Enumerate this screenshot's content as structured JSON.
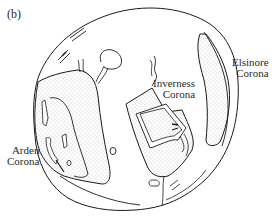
{
  "figure": {
    "panel_label": "(b)",
    "colors": {
      "line": "#1a1a1a",
      "stipple": "#8a8a8a",
      "background": "#ffffff",
      "text": "#2a2a2a"
    },
    "labels": {
      "elsinore": {
        "line1": "Elsinore",
        "line2": "Corona"
      },
      "inverness": {
        "line1": "Inverness",
        "line2": "Corona"
      },
      "arden": {
        "line1": "Arden",
        "line2": "Corona"
      }
    },
    "legend": {
      "stippled": "corona terrain"
    }
  }
}
